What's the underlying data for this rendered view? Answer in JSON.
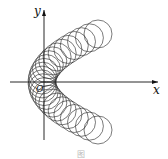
{
  "figure": {
    "axis_x_label": "x",
    "axis_y_label": "y",
    "origin_label": "O",
    "caption": "图 "
  }
}
